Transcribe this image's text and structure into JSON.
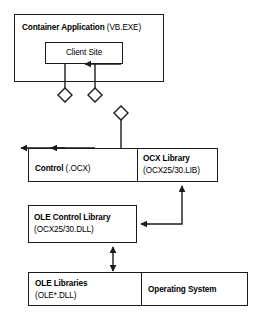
{
  "diagram": {
    "colors": {
      "background": "#ffffff",
      "stroke": "#1a1a1a",
      "text": "#000000"
    },
    "container_application": {
      "title": "Container Application",
      "subtitle": "(VB.EXE)",
      "client_site": {
        "label": "Client Site"
      }
    },
    "control_row": {
      "control": {
        "title": "Control",
        "subtitle": "(.OCX)"
      },
      "ocx_library": {
        "title": "OCX Library",
        "subtitle": "(OCX25/30.LIB)"
      }
    },
    "ole_control_library": {
      "title": "OLE Control Library",
      "subtitle": "(OCX25/30.DLL)"
    },
    "bottom_row": {
      "ole_libraries": {
        "title": "OLE Libraries",
        "subtitle": "(OLE*.DLL)"
      },
      "operating_system": {
        "title": "Operating System"
      }
    },
    "connectors": [
      {
        "name": "client-site-to-control-1",
        "shape": "diamond-with-up-arrow",
        "direction": "up",
        "from": "Control (.OCX)",
        "to": "Client Site"
      },
      {
        "name": "client-site-to-control-2",
        "shape": "diamond-with-up-arrow",
        "direction": "up",
        "from": "Control (.OCX)",
        "to": "Client Site"
      },
      {
        "name": "client-site-to-ocx-library-3",
        "shape": "diamond-with-down-arrow",
        "direction": "down",
        "from": "Client Site",
        "to": "Control (.OCX)"
      },
      {
        "name": "ole-control-library-to-ocx-library",
        "shape": "elbow-arrow",
        "direction": "bidirectional-elbow",
        "from": "OLE Control Library",
        "to": "OCX Library"
      },
      {
        "name": "ole-control-library-to-ole-libraries",
        "shape": "double-headed-arrow",
        "direction": "both",
        "from": "OLE Control Library",
        "to": "OLE Libraries"
      }
    ]
  }
}
